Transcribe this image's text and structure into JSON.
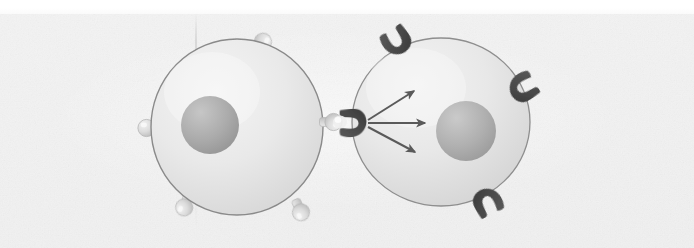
{
  "figure": {
    "caption": "",
    "width": 694,
    "height": 248,
    "medium": "scanned textbook line illustration, grayscale"
  },
  "palette": {
    "paper": "#f1f1f1",
    "paper_highlight": "#fbfbfb",
    "page_white": "#ffffff",
    "cell_fill_light": "#ededed",
    "cell_fill_shade": "#d8d8d8",
    "cell_outline": "#8a8a8a",
    "nucleus_light": "#bdbdbd",
    "nucleus_dark": "#9a9a9a",
    "ligand_light": "#e2e2e2",
    "ligand_shade": "#bcbcbc",
    "ligand_outline": "#b0b0b0",
    "receptor_dark": "#4a4a4a",
    "receptor_darker": "#3a3a3a",
    "arrow": "#5a5a5a",
    "crease": "#b4b4b4"
  },
  "cells": [
    {
      "id": "signaling-cell",
      "role": "signaling cell",
      "label": "",
      "center": {
        "x": 237,
        "y": 127
      },
      "radius_x": 86,
      "radius_y": 88,
      "outline_width": 1.4,
      "nucleus": {
        "label": "",
        "center": {
          "x": 210,
          "y": 125
        },
        "radius": 29
      },
      "surface_molecules": [
        {
          "type": "ligand",
          "label": "",
          "angle_deg": -68,
          "x": 262,
          "y": 44,
          "stalk_deg": 112,
          "size": 10
        },
        {
          "type": "ligand",
          "label": "",
          "angle_deg": 180,
          "x": 149,
          "y": 128,
          "stalk_deg": 0,
          "size": 10
        },
        {
          "type": "ligand",
          "label": "",
          "angle_deg": 108,
          "x": 185,
          "y": 205,
          "stalk_deg": -72,
          "size": 10
        },
        {
          "type": "ligand",
          "label": "",
          "angle_deg": 66,
          "x": 300,
          "y": 210,
          "stalk_deg": -114,
          "size": 10
        },
        {
          "type": "ligand",
          "label": "",
          "angle_deg": 0,
          "x": 331,
          "y": 122,
          "stalk_deg": 180,
          "size": 10,
          "bound": true
        }
      ]
    },
    {
      "id": "target-cell",
      "role": "target cell",
      "label": "",
      "center": {
        "x": 441,
        "y": 122
      },
      "radius_x": 89,
      "radius_y": 84,
      "outline_width": 1.3,
      "nucleus": {
        "label": "",
        "center": {
          "x": 466,
          "y": 131
        },
        "radius": 30
      },
      "surface_molecules": [
        {
          "type": "receptor",
          "label": "",
          "x": 397,
          "y": 40,
          "rotation_deg": -34,
          "size": 26,
          "bound": false
        },
        {
          "type": "receptor",
          "label": "",
          "x": 524,
          "y": 88,
          "rotation_deg": 58,
          "size": 26,
          "bound": false
        },
        {
          "type": "receptor",
          "label": "",
          "x": 487,
          "y": 203,
          "rotation_deg": 152,
          "size": 26,
          "bound": false
        },
        {
          "type": "receptor",
          "label": "",
          "x": 352,
          "y": 122,
          "rotation_deg": 0,
          "size": 27,
          "bound": true
        }
      ]
    }
  ],
  "binding_event": {
    "label": "",
    "ligand_cell": "signaling-cell",
    "receptor_cell": "target-cell",
    "junction": {
      "x": 347,
      "y": 122
    }
  },
  "signal_arrows": {
    "label": "",
    "origin": {
      "x": 366,
      "y": 122
    },
    "count": 3,
    "color": "#5a5a5a",
    "rays": [
      {
        "id": "arrow-up",
        "angle_deg": -32,
        "length": 60,
        "tip": {
          "x": 417,
          "y": 90
        }
      },
      {
        "id": "arrow-middle",
        "angle_deg": 0,
        "length": 62,
        "tip": {
          "x": 428,
          "y": 122
        }
      },
      {
        "id": "arrow-down",
        "angle_deg": 30,
        "length": 60,
        "tip": {
          "x": 418,
          "y": 153
        }
      }
    ]
  }
}
